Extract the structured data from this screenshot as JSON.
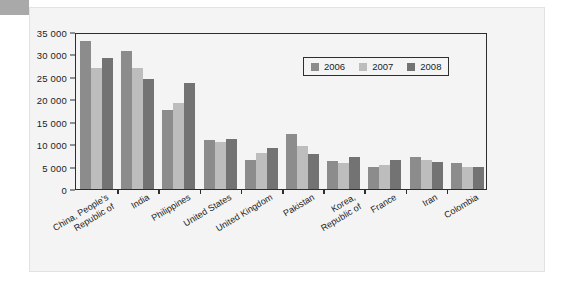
{
  "chart_data": {
    "type": "bar",
    "title": "",
    "subtitle": "",
    "xlabel": "",
    "ylabel": "",
    "ylim": [
      0,
      35000
    ],
    "grid": false,
    "legend_position": "top-right",
    "ytick_labels": [
      "0",
      "5 000",
      "10 000",
      "15 000",
      "20 000",
      "25 000",
      "30 000",
      "35 000"
    ],
    "ytick_values": [
      0,
      5000,
      10000,
      15000,
      20000,
      25000,
      30000,
      35000
    ],
    "categories": [
      "China, People's Republic of",
      "India",
      "Philippines",
      "United States",
      "United Kingdom",
      "Pakistan",
      "Korea, Republic of",
      "France",
      "Iran",
      "Colombia"
    ],
    "category_lines": [
      [
        "China, People's",
        "Republic of"
      ],
      [
        "India"
      ],
      [
        "Philippines"
      ],
      [
        "United States"
      ],
      [
        "United Kingdom"
      ],
      [
        "Pakistan"
      ],
      [
        "Korea,",
        "Republic of"
      ],
      [
        "France"
      ],
      [
        "Iran"
      ],
      [
        "Colombia"
      ]
    ],
    "series": [
      {
        "name": "2006",
        "color": "#8c8c8c",
        "values": [
          33000,
          30700,
          17600,
          10900,
          6500,
          12300,
          6200,
          4900,
          7100,
          5800
        ]
      },
      {
        "name": "2007",
        "color": "#bdbdbd",
        "values": [
          27000,
          27000,
          19100,
          10400,
          8100,
          9500,
          5800,
          5400,
          6500,
          4800
        ]
      },
      {
        "name": "2008",
        "color": "#737373",
        "values": [
          29300,
          24600,
          23700,
          11200,
          9200,
          7900,
          7200,
          6400,
          6000,
          4900
        ]
      }
    ]
  },
  "legend": {
    "items": [
      {
        "label": "2006",
        "color": "#8c8c8c"
      },
      {
        "label": "2007",
        "color": "#bdbdbd"
      },
      {
        "label": "2008",
        "color": "#737373"
      }
    ]
  },
  "colors": {
    "series_2006": "#8c8c8c",
    "series_2007": "#bdbdbd",
    "series_2008": "#737373",
    "axis": "#2e2e2e",
    "panel_background": "#f4f4f4",
    "page_background": "#ffffff",
    "corner_tab": "#a9a9a9"
  }
}
